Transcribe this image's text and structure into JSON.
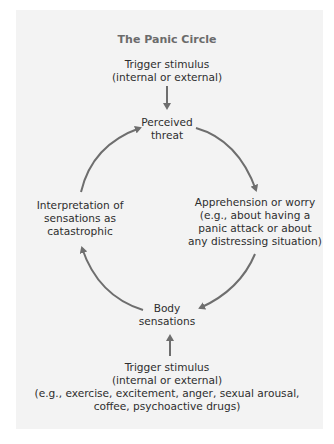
{
  "title": "The Panic Circle",
  "nodes": {
    "top_trigger": "Trigger stimulus\n(internal or external)",
    "perceived_threat": "Perceived\nthreat",
    "apprehension": "Apprehension or worry\n(e.g., about having a\npanic attack or about\nany distressing situation)",
    "body_sensations": "Body\nsensations",
    "interpretation": "Interpretation of\nsensations as\ncatastrophic",
    "bottom_trigger": "Trigger stimulus\n(internal or external)\n(e.g., exercise, excitement, anger, sexual arousal,\ncoffee, psychoactive drugs)"
  },
  "colors": {
    "panel": "#f3f3f3",
    "arrow": "#6e6e6e",
    "title": "#6b6b6b",
    "text": "#2e2e2e"
  }
}
